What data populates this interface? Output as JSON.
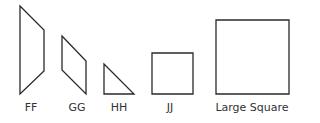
{
  "diagram": {
    "stroke_color": "#2a2a2a",
    "shapes": [
      {
        "id": "FF",
        "label": "FF",
        "kind": "quadrilateral",
        "points": "20,6 44,30 44,71 20,94",
        "label_x": 31
      },
      {
        "id": "GG",
        "label": "GG",
        "kind": "parallelogram",
        "points": "62,36 86,61 86,94 62,70",
        "label_x": 77
      },
      {
        "id": "HH",
        "label": "HH",
        "kind": "right-triangle",
        "points": "104,64 134,94 104,94",
        "label_x": 119
      },
      {
        "id": "JJ",
        "label": "JJ",
        "kind": "square",
        "points": "152,53 193,53 193,94 152,94",
        "label_x": 170
      },
      {
        "id": "LargeSquare",
        "label": "Large Square",
        "kind": "square",
        "points": "216,20 289,20 289,94 216,94",
        "label_x": 252
      }
    ]
  }
}
